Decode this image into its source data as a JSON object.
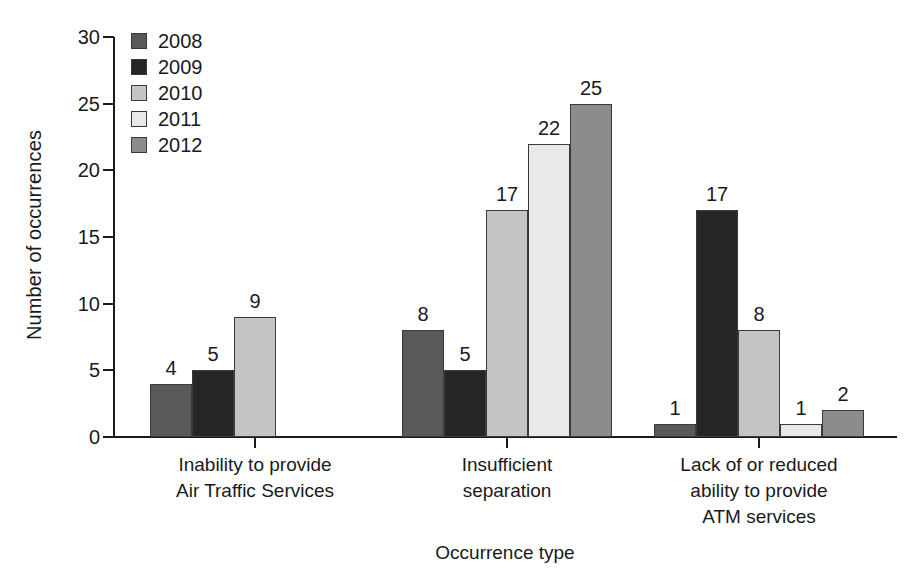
{
  "chart_data": {
    "type": "bar",
    "title": "",
    "xlabel": "Occurrence type",
    "ylabel": "Number of occurrences",
    "ylim": [
      0,
      30
    ],
    "ytick_step": 5,
    "yticks": [
      0,
      5,
      10,
      15,
      20,
      25,
      30
    ],
    "grid": false,
    "legend_position": "top-left inside plot",
    "categories": [
      "Inability to provide\nAir Traffic Services",
      "Insufficient\nseparation",
      "Lack of or reduced\nability to provide\nATM services"
    ],
    "category_lines": [
      [
        "Inability to provide",
        "Air Traffic Services"
      ],
      [
        "Insufficient",
        "separation"
      ],
      [
        "Lack of or reduced",
        "ability to provide",
        "ATM services"
      ]
    ],
    "series": [
      {
        "name": "2008",
        "color": "#595959",
        "values": [
          4,
          8,
          1
        ]
      },
      {
        "name": "2009",
        "color": "#262626",
        "values": [
          5,
          5,
          17
        ]
      },
      {
        "name": "2010",
        "color": "#c4c4c4",
        "values": [
          9,
          17,
          8
        ]
      },
      {
        "name": "2011",
        "color": "#e9e9e9",
        "values": [
          0,
          22,
          1
        ]
      },
      {
        "name": "2012",
        "color": "#8c8c8c",
        "values": [
          0,
          25,
          2
        ]
      }
    ],
    "data_labels": {
      "Inability to provide Air Traffic Services": [
        "4",
        "5",
        "9",
        "",
        ""
      ],
      "Insufficient separation": [
        "8",
        "5",
        "17",
        "22",
        "25"
      ],
      "Lack of or reduced ability to provide ATM services": [
        "1",
        "17",
        "8",
        "1",
        "2"
      ]
    },
    "axis_color": "#1a1a1a",
    "background_color": "#ffffff"
  },
  "legend": {
    "items": [
      {
        "label": "2008",
        "color": "#595959"
      },
      {
        "label": "2009",
        "color": "#262626"
      },
      {
        "label": "2010",
        "color": "#c4c4c4"
      },
      {
        "label": "2011",
        "color": "#e9e9e9"
      },
      {
        "label": "2012",
        "color": "#8c8c8c"
      }
    ]
  },
  "axes": {
    "y_title": "Number of occurrences",
    "x_title": "Occurrence type",
    "y_tick_labels": [
      "30",
      "25",
      "20",
      "15",
      "10",
      "5",
      "0"
    ]
  }
}
